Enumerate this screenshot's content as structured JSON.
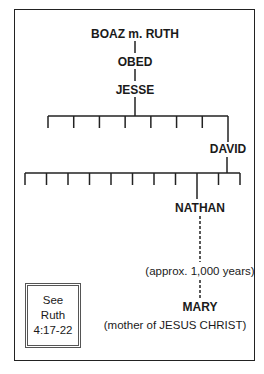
{
  "diagram": {
    "type": "genealogy",
    "nodes": {
      "boaz_ruth": "BOAZ m. RUTH",
      "obed": "OBED",
      "jesse": "JESSE",
      "david": "DAVID",
      "nathan": "NATHAN",
      "mary": "MARY"
    },
    "jesse_sons_count": 8,
    "david_sons_count": 11,
    "gap_note": "(approx. 1,000 years)",
    "mary_note": "(mother of JESUS CHRIST)",
    "reference": [
      "See",
      "Ruth",
      "4:17-22"
    ]
  }
}
